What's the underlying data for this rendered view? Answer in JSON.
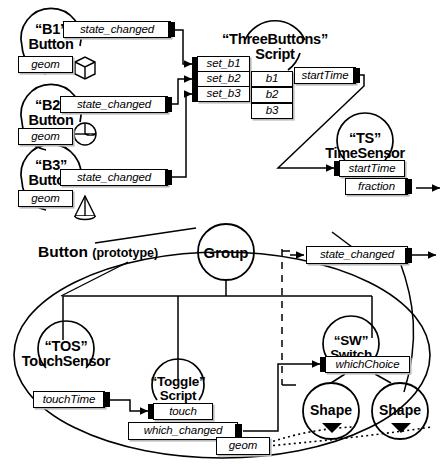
{
  "diagram": {
    "proto_label": {
      "name": "Button",
      "qualifier": "(prototype)"
    }
  },
  "top_section": {
    "buttons": [
      {
        "name": "“B1”",
        "type": "Button",
        "field": "geom",
        "event_out": "state_changed",
        "shape_icon": "cube-icon"
      },
      {
        "name": "“B2”",
        "type": "Button",
        "field": "geom",
        "event_out": "state_changed",
        "shape_icon": "sphere-icon"
      },
      {
        "name": "“B3”",
        "type": "Button",
        "field": "geom",
        "event_out": "state_changed",
        "shape_icon": "cone-icon"
      }
    ],
    "script_node": {
      "name": "“ThreeButtons”",
      "type": "Script",
      "event_ins": [
        "set_b1",
        "set_b2",
        "set_b3"
      ],
      "fields": [
        "b1",
        "b2",
        "b3"
      ],
      "event_out": "startTime"
    },
    "time_sensor": {
      "name": "“TS”",
      "type": "TimeSensor",
      "event_in": "startTime",
      "event_out": "fraction"
    }
  },
  "proto_section": {
    "group_node": {
      "label": "Group"
    },
    "exposed_event": "state_changed",
    "touch_sensor": {
      "name": "“TOS”",
      "type": "TouchSensor",
      "event_out": "touchTime"
    },
    "toggle_script": {
      "name": "“Toggle”",
      "type": "Script",
      "event_in": "touch",
      "event_out": "which_changed"
    },
    "switch_node": {
      "name": "“SW”",
      "type": "Switch",
      "field": "whichChoice"
    },
    "shapes": [
      {
        "label": "Shape",
        "marker": "play-triangle-icon"
      },
      {
        "label": "Shape",
        "marker": "play-triangle-icon"
      }
    ],
    "geom_field": "geom"
  },
  "colors": {
    "ink": "#000000",
    "paper": "#ffffff",
    "shadow": "#b9b9b9"
  }
}
